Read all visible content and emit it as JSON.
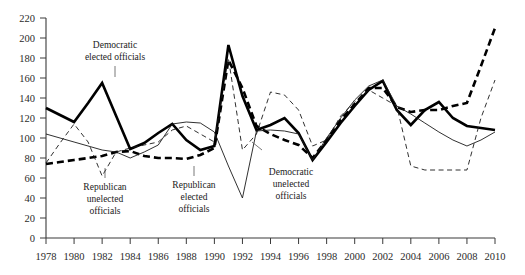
{
  "chart_data": {
    "type": "line",
    "title": "",
    "subtitle": "",
    "xlabel": "",
    "ylabel": "",
    "xlim": [
      1978,
      2010
    ],
    "ylim": [
      0,
      220
    ],
    "ytick_step": 20,
    "xtick_step": 2,
    "grid": false,
    "legend_position": "inline-annotations",
    "yticks": [
      0,
      20,
      40,
      60,
      80,
      100,
      120,
      140,
      160,
      180,
      200,
      220
    ],
    "xticks": [
      1978,
      1980,
      1982,
      1984,
      1986,
      1988,
      1990,
      1992,
      1994,
      1996,
      1998,
      2000,
      2002,
      2004,
      2006,
      2008,
      2010
    ],
    "x": [
      1978,
      1979,
      1980,
      1981,
      1982,
      1983,
      1984,
      1985,
      1986,
      1987,
      1988,
      1989,
      1990,
      1991,
      1992,
      1993,
      1994,
      1995,
      1996,
      1997,
      1998,
      1999,
      2000,
      2001,
      2002,
      2003,
      2004,
      2005,
      2006,
      2007,
      2008,
      2009,
      2010
    ],
    "series": [
      {
        "name": "Democratic elected officials",
        "style": "thick-solid",
        "color": "#000000",
        "values": [
          130,
          123,
          116,
          135,
          155,
          122,
          89,
          95,
          105,
          114,
          98,
          88,
          92,
          193,
          142,
          108,
          113,
          120,
          105,
          78,
          96,
          115,
          132,
          148,
          157,
          128,
          113,
          128,
          136,
          120,
          112,
          110,
          108
        ]
      },
      {
        "name": "Republican elected officials",
        "style": "thick-dashed",
        "color": "#000000",
        "values": [
          74,
          76,
          78,
          80,
          82,
          86,
          87,
          82,
          80,
          80,
          79,
          83,
          90,
          178,
          150,
          112,
          104,
          98,
          93,
          80,
          98,
          118,
          134,
          150,
          150,
          131,
          126,
          128,
          128,
          132,
          135,
          172,
          210
        ]
      },
      {
        "name": "Democratic unelected officials",
        "style": "thin-solid",
        "color": "#1a1a1a",
        "values": [
          104,
          100,
          96,
          92,
          88,
          86,
          80,
          86,
          93,
          114,
          116,
          115,
          106,
          72,
          40,
          107,
          108,
          107,
          104,
          78,
          100,
          120,
          138,
          152,
          158,
          132,
          124,
          115,
          106,
          98,
          92,
          98,
          106
        ]
      },
      {
        "name": "Republican unelected officials",
        "style": "thin-dashed",
        "color": "#1a1a1a",
        "values": [
          75,
          95,
          114,
          96,
          62,
          86,
          90,
          93,
          96,
          108,
          112,
          104,
          96,
          180,
          88,
          104,
          146,
          143,
          128,
          92,
          98,
          122,
          136,
          148,
          140,
          132,
          72,
          68,
          68,
          68,
          68,
          120,
          158
        ]
      }
    ],
    "annotations": [
      {
        "text_lines": [
          "Democratic",
          "elected officials"
        ],
        "x_px": 115,
        "y_px": 48,
        "leader_x1": 115,
        "leader_y1": 66,
        "leader_x2": 115,
        "leader_y2": 77
      },
      {
        "text_lines": [
          "Republican",
          "unelected",
          "officials"
        ],
        "x_px": 105,
        "y_px": 190,
        "leader_x1": 105,
        "leader_y1": 178,
        "leader_x2": 105,
        "leader_y2": 168
      },
      {
        "text_lines": [
          "Republican",
          "elected",
          "officials"
        ],
        "x_px": 194,
        "y_px": 188,
        "leader_x1": 194,
        "leader_y1": 176,
        "leader_x2": 194,
        "leader_y2": 166
      },
      {
        "text_lines": [
          "Democratic",
          "unelected",
          "officials"
        ],
        "x_px": 291,
        "y_px": 175,
        "leader_x1": 262,
        "leader_y1": 150,
        "leader_x2": 252,
        "leader_y2": 142
      }
    ]
  },
  "axes": {
    "y_axis_name": "value-axis",
    "x_axis_name": "year-axis"
  }
}
